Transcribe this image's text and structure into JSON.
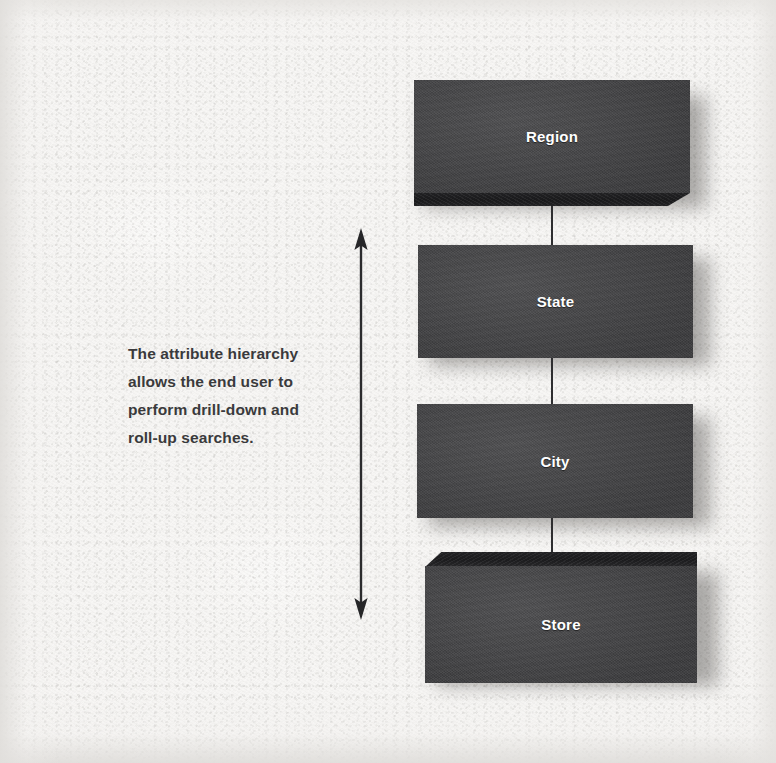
{
  "diagram": {
    "caption": {
      "lines": [
        "The attribute hierarchy",
        "allows the end user to",
        "perform drill-down and",
        "roll-up searches."
      ],
      "full_text": "The attribute hierarchy allows the end user to perform drill-down and roll-up searches."
    },
    "arrow": {
      "name": "double-headed-vertical-arrow",
      "direction": "bidirectional-vertical",
      "meaning": "drill-down and roll-up"
    },
    "nodes": [
      {
        "id": "region",
        "label": "Region",
        "level": 1
      },
      {
        "id": "state",
        "label": "State",
        "level": 2
      },
      {
        "id": "city",
        "label": "City",
        "level": 3
      },
      {
        "id": "store",
        "label": "Store",
        "level": 4
      }
    ],
    "connectors": [
      {
        "from": "region",
        "to": "state"
      },
      {
        "from": "state",
        "to": "city"
      },
      {
        "from": "city",
        "to": "store"
      }
    ],
    "colors": {
      "background": "#f6f5f3",
      "box_face": "#464648",
      "box_edge": "#1d1d1f",
      "box_label": "#ffffff",
      "caption_text": "#3a3a3c",
      "line": "#2e2e30"
    }
  }
}
